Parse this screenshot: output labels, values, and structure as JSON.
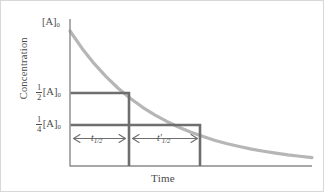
{
  "figure": {
    "caption": "First-order reaction half-life diagram"
  },
  "axes": {
    "y_title": "Concentration",
    "x_title": "Time",
    "x_range": [
      0,
      100
    ],
    "y_range": [
      0,
      1
    ],
    "grid": false
  },
  "labels": {
    "initial": {
      "bracket": "[A]",
      "subscript": "0"
    },
    "half": {
      "numerator": "1",
      "denominator": "2",
      "bracket": "[A]",
      "subscript": "0"
    },
    "quarter": {
      "numerator": "1",
      "denominator": "4",
      "bracket": "[A]",
      "subscript": "0"
    }
  },
  "annotations": {
    "half_life_1": {
      "symbol": "t",
      "prime": "",
      "subscript": "1/2"
    },
    "half_life_2": {
      "symbol": "t",
      "prime": "′",
      "subscript": "1/2"
    }
  },
  "colors": {
    "curve": "#b6b6b6",
    "guide": "#6e6e6e",
    "axis": "#8a8a8a",
    "text": "#4a4a4a",
    "background": "#ffffff",
    "border": "#d8d8d8"
  },
  "chart_data": {
    "type": "line",
    "title": "",
    "subtitle": "",
    "xlabel": "Time",
    "ylabel": "Concentration",
    "xlim": [
      0,
      100
    ],
    "ylim": [
      0,
      1.05
    ],
    "grid": false,
    "legend": "none",
    "model": "exponential decay, first order: [A] = [A]0 * exp(-k*t)",
    "series": [
      {
        "name": "[A] vs time",
        "color": "#b6b6b6",
        "x": [
          0,
          5,
          10,
          15,
          20,
          25,
          30,
          35,
          40,
          45,
          50,
          55,
          60,
          65,
          70,
          75,
          80,
          85,
          90,
          95,
          100
        ],
        "y": [
          1.0,
          0.871,
          0.758,
          0.66,
          0.574,
          0.5,
          0.435,
          0.379,
          0.33,
          0.287,
          0.25,
          0.218,
          0.189,
          0.165,
          0.144,
          0.125,
          0.109,
          0.095,
          0.082,
          0.072,
          0.0625
        ]
      }
    ],
    "reference_levels": [
      {
        "label": "1/2 [A]0",
        "y": 0.5,
        "x_intercept": 25
      },
      {
        "label": "1/4 [A]0",
        "y": 0.25,
        "x_intercept": 50
      }
    ],
    "intervals": [
      {
        "label": "t 1/2",
        "x_start": 0,
        "x_end": 25,
        "y": 0.135
      },
      {
        "label": "t' 1/2",
        "x_start": 25,
        "x_end": 50,
        "y": 0.135
      }
    ],
    "annotations": [
      {
        "text": "[A]0",
        "x": 0,
        "y": 1.0
      },
      {
        "text": "1/2 [A]0",
        "x": 0,
        "y": 0.5
      },
      {
        "text": "1/4 [A]0",
        "x": 0,
        "y": 0.25
      }
    ]
  }
}
